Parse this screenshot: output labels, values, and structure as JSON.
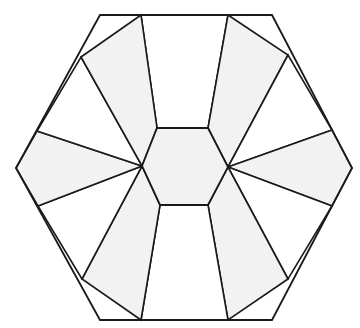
{
  "figure": {
    "canvas": {
      "width": 360,
      "height": 328
    },
    "background_color": "#ffffff",
    "stroke_color": "#1a1a1a",
    "fill_light": "#f2f2f2",
    "fill_white": "#ffffff"
  },
  "chart_data": {
    "type": "diagram",
    "outer_hexagon": {
      "name": "outer-hexagon",
      "points": "100,15 272,15 352,168 272,320 100,320 16,168"
    },
    "inner_hexagon": {
      "name": "inner-hexagon",
      "fill": "#f2f2f2",
      "points": "157,128 208,128 228,167 208,205 160,205 142,166"
    },
    "edge_nodes": [
      {
        "name": "top-edge-left",
        "x": 141,
        "y": 15
      },
      {
        "name": "top-edge-right",
        "x": 228,
        "y": 15
      },
      {
        "name": "upper-right-edge-node",
        "x": 288,
        "y": 55
      },
      {
        "name": "lower-right-edge-node",
        "x": 332,
        "y": 130
      },
      {
        "name": "right-edge-lower-node",
        "x": 332,
        "y": 206
      },
      {
        "name": "bottom-right-edge-node",
        "x": 288,
        "y": 279
      },
      {
        "name": "bottom-edge-right",
        "x": 228,
        "y": 320
      },
      {
        "name": "bottom-edge-left",
        "x": 141,
        "y": 320
      },
      {
        "name": "bottom-left-edge-node",
        "x": 82,
        "y": 279
      },
      {
        "name": "left-edge-lower-node",
        "x": 38,
        "y": 206
      },
      {
        "name": "left-edge-upper-node",
        "x": 37,
        "y": 131
      },
      {
        "name": "upper-left-edge-node",
        "x": 81,
        "y": 57
      }
    ],
    "panels": [
      {
        "name": "panel-top-center",
        "shade": "white",
        "points": "141,15 228,15 208,128 157,128"
      },
      {
        "name": "panel-top-right",
        "shade": "light",
        "points": "228,15 288,55 228,167 208,128"
      },
      {
        "name": "panel-right-upper",
        "shade": "white",
        "points": "288,55 332,130 228,167"
      },
      {
        "name": "panel-right-mid",
        "shade": "light",
        "points": "332,130 352,168 332,206 228,167"
      },
      {
        "name": "panel-right-lower",
        "shade": "white",
        "points": "332,206 288,279 228,167"
      },
      {
        "name": "panel-bottom-right",
        "shade": "light",
        "points": "288,279 228,320 208,205 228,167"
      },
      {
        "name": "panel-bottom-center",
        "shade": "white",
        "points": "228,320 141,320 160,205 208,205"
      },
      {
        "name": "panel-bottom-left",
        "shade": "light",
        "points": "141,320 82,279 142,166 160,205"
      },
      {
        "name": "panel-left-lower",
        "shade": "white",
        "points": "82,279 38,206 142,166"
      },
      {
        "name": "panel-left-mid",
        "shade": "light",
        "points": "38,206 16,168 37,131 142,166"
      },
      {
        "name": "panel-left-upper",
        "shade": "white",
        "points": "37,131 81,57 142,166"
      },
      {
        "name": "panel-top-left",
        "shade": "light",
        "points": "81,57 141,15 157,128 142,166"
      }
    ]
  }
}
